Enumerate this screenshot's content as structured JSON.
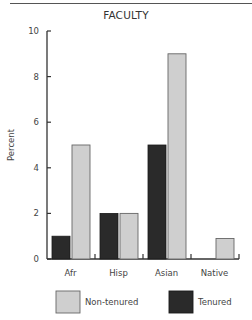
{
  "chart_data": {
    "type": "bar",
    "title": "FACULTY",
    "xlabel": "",
    "ylabel": "Percent",
    "ylim": [
      0,
      10
    ],
    "yticks": [
      0,
      2,
      4,
      6,
      8,
      10
    ],
    "grid": false,
    "legend_position": "bottom",
    "categories": [
      "Afr",
      "Hisp",
      "Asian",
      "Native"
    ],
    "series": [
      {
        "name": "Tenured",
        "color": "#2a2a2a",
        "values": [
          1,
          2,
          5,
          0
        ]
      },
      {
        "name": "Non-tenured",
        "color": "#cfcfcf",
        "values": [
          5,
          2,
          9,
          0.9
        ]
      }
    ],
    "legend": [
      {
        "label": "Non-tenured",
        "color": "#cfcfcf"
      },
      {
        "label": "Tenured",
        "color": "#2a2a2a"
      }
    ]
  }
}
